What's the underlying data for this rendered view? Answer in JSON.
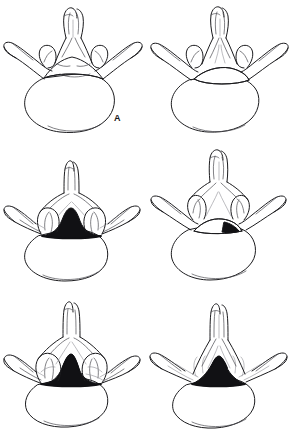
{
  "figure": {
    "domain": "anatomical-line-drawing-plate",
    "background_color": "#ffffff",
    "ink_color": "#1b1b1e",
    "layout": {
      "columns": 2,
      "rows": 3,
      "panel_width": 145,
      "panel_height": 143
    }
  },
  "panels": [
    {
      "id": "a",
      "label": "A",
      "canal_shape": "wide-triangular",
      "canal_fill": "open",
      "caption": ""
    },
    {
      "id": "b",
      "label": "B",
      "canal_shape": "flattened-triangular",
      "canal_fill": "open",
      "caption": ""
    },
    {
      "id": "c",
      "label": "C",
      "canal_shape": "trefoil-narrowed",
      "canal_fill": "dark",
      "caption": ""
    },
    {
      "id": "d",
      "label": "D",
      "canal_shape": "crescent-narrowed",
      "canal_fill": "partial-dark",
      "caption": ""
    },
    {
      "id": "e",
      "label": "E",
      "canal_shape": "severely-stenotic-slit",
      "canal_fill": "dark",
      "caption": ""
    },
    {
      "id": "f",
      "label": "F",
      "canal_shape": "small-triangular-stenotic",
      "canal_fill": "dark",
      "caption": ""
    }
  ]
}
